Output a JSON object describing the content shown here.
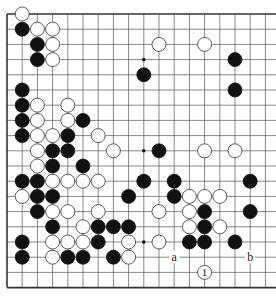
{
  "diagram": {
    "type": "go-board-partial",
    "grid": {
      "origin_x": 7,
      "origin_y": 14,
      "spacing": 15.2,
      "rows": 19,
      "cols_visible": 19,
      "stone_radius": 7,
      "line_color": "#555555",
      "border_color": "#333333",
      "borders": {
        "top": true,
        "left": true,
        "bottom": true,
        "right": false
      }
    },
    "colors": {
      "black_stone": "#111111",
      "white_stone_fill": "#ffffff",
      "white_stone_stroke": "#333333",
      "background": "#ffffff"
    },
    "star_points": [
      {
        "col": 9,
        "row": 3
      },
      {
        "col": 9,
        "row": 9
      },
      {
        "col": 9,
        "row": 15
      }
    ],
    "stones": [
      {
        "color": "white",
        "col": 1,
        "row": 0
      },
      {
        "color": "black",
        "col": 1,
        "row": 1
      },
      {
        "color": "white",
        "col": 2,
        "row": 1
      },
      {
        "color": "white",
        "col": 3,
        "row": 1
      },
      {
        "color": "black",
        "col": 2,
        "row": 2
      },
      {
        "color": "white",
        "col": 3,
        "row": 2
      },
      {
        "color": "white",
        "col": 10,
        "row": 2
      },
      {
        "color": "white",
        "col": 13,
        "row": 2
      },
      {
        "color": "black",
        "col": 2,
        "row": 3
      },
      {
        "color": "white",
        "col": 3,
        "row": 3
      },
      {
        "color": "black",
        "col": 15,
        "row": 3
      },
      {
        "color": "black",
        "col": 9,
        "row": 4
      },
      {
        "color": "black",
        "col": 1,
        "row": 5
      },
      {
        "color": "black",
        "col": 15,
        "row": 5
      },
      {
        "color": "black",
        "col": 1,
        "row": 6
      },
      {
        "color": "white",
        "col": 2,
        "row": 6
      },
      {
        "color": "white",
        "col": 4,
        "row": 6
      },
      {
        "color": "black",
        "col": 1,
        "row": 7
      },
      {
        "color": "white",
        "col": 2,
        "row": 7
      },
      {
        "color": "white",
        "col": 4,
        "row": 7
      },
      {
        "color": "black",
        "col": 5,
        "row": 7
      },
      {
        "color": "black",
        "col": 1,
        "row": 8
      },
      {
        "color": "white",
        "col": 2,
        "row": 8
      },
      {
        "color": "white",
        "col": 3,
        "row": 8
      },
      {
        "color": "black",
        "col": 4,
        "row": 8
      },
      {
        "color": "white",
        "col": 6,
        "row": 8
      },
      {
        "color": "white",
        "col": 2,
        "row": 9
      },
      {
        "color": "black",
        "col": 3,
        "row": 9
      },
      {
        "color": "black",
        "col": 4,
        "row": 9
      },
      {
        "color": "white",
        "col": 7,
        "row": 9
      },
      {
        "color": "black",
        "col": 10,
        "row": 9
      },
      {
        "color": "white",
        "col": 13,
        "row": 9
      },
      {
        "color": "white",
        "col": 15,
        "row": 9
      },
      {
        "color": "white",
        "col": 2,
        "row": 10
      },
      {
        "color": "black",
        "col": 3,
        "row": 10
      },
      {
        "color": "black",
        "col": 5,
        "row": 10
      },
      {
        "color": "black",
        "col": 1,
        "row": 11
      },
      {
        "color": "black",
        "col": 2,
        "row": 11
      },
      {
        "color": "white",
        "col": 3,
        "row": 11
      },
      {
        "color": "white",
        "col": 4,
        "row": 11
      },
      {
        "color": "white",
        "col": 5,
        "row": 11
      },
      {
        "color": "white",
        "col": 6,
        "row": 11
      },
      {
        "color": "black",
        "col": 9,
        "row": 11
      },
      {
        "color": "black",
        "col": 11,
        "row": 11
      },
      {
        "color": "black",
        "col": 16,
        "row": 11
      },
      {
        "color": "white",
        "col": 1,
        "row": 12
      },
      {
        "color": "black",
        "col": 2,
        "row": 12
      },
      {
        "color": "black",
        "col": 3,
        "row": 12
      },
      {
        "color": "black",
        "col": 8,
        "row": 12
      },
      {
        "color": "black",
        "col": 11,
        "row": 12
      },
      {
        "color": "white",
        "col": 12,
        "row": 12
      },
      {
        "color": "white",
        "col": 13,
        "row": 12
      },
      {
        "color": "white",
        "col": 14,
        "row": 12
      },
      {
        "color": "black",
        "col": 2,
        "row": 13
      },
      {
        "color": "white",
        "col": 3,
        "row": 13
      },
      {
        "color": "white",
        "col": 4,
        "row": 13
      },
      {
        "color": "white",
        "col": 6,
        "row": 13
      },
      {
        "color": "white",
        "col": 10,
        "row": 13
      },
      {
        "color": "white",
        "col": 12,
        "row": 13
      },
      {
        "color": "black",
        "col": 13,
        "row": 13
      },
      {
        "color": "black",
        "col": 16,
        "row": 13
      },
      {
        "color": "black",
        "col": 3,
        "row": 14
      },
      {
        "color": "white",
        "col": 5,
        "row": 14
      },
      {
        "color": "black",
        "col": 6,
        "row": 14
      },
      {
        "color": "black",
        "col": 7,
        "row": 14
      },
      {
        "color": "black",
        "col": 8,
        "row": 14
      },
      {
        "color": "white",
        "col": 12,
        "row": 14
      },
      {
        "color": "black",
        "col": 13,
        "row": 14
      },
      {
        "color": "white",
        "col": 14,
        "row": 14
      },
      {
        "color": "black",
        "col": 1,
        "row": 15
      },
      {
        "color": "white",
        "col": 3,
        "row": 15
      },
      {
        "color": "white",
        "col": 4,
        "row": 15
      },
      {
        "color": "white",
        "col": 5,
        "row": 15
      },
      {
        "color": "black",
        "col": 6,
        "row": 15
      },
      {
        "color": "white",
        "col": 8,
        "row": 15
      },
      {
        "color": "white",
        "col": 10,
        "row": 15
      },
      {
        "color": "black",
        "col": 12,
        "row": 15
      },
      {
        "color": "black",
        "col": 13,
        "row": 15
      },
      {
        "color": "black",
        "col": 15,
        "row": 15
      },
      {
        "color": "black",
        "col": 1,
        "row": 16
      },
      {
        "color": "white",
        "col": 3,
        "row": 16
      },
      {
        "color": "black",
        "col": 4,
        "row": 16
      },
      {
        "color": "black",
        "col": 5,
        "row": 16
      },
      {
        "color": "black",
        "col": 7,
        "row": 16
      },
      {
        "color": "white",
        "col": 8,
        "row": 16
      },
      {
        "color": "white",
        "col": 13,
        "row": 17,
        "number": "1"
      }
    ],
    "labels": [
      {
        "text": "a",
        "col": 11,
        "row": 16
      },
      {
        "text": "b",
        "col": 16,
        "row": 16
      }
    ]
  }
}
